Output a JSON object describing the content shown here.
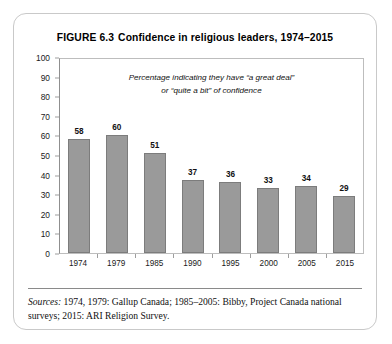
{
  "figure": {
    "label": "FIGURE 6.3",
    "title": "Confidence in religious leaders, 1974–2015",
    "annotation_line1": "Percentage indicating they have “a great deal”",
    "annotation_line2": "or “quite a bit” of confidence",
    "sources_label": "Sources:",
    "sources_text": " 1974, 1979: Gallup Canada; 1985–2005: Bibby, Project Canada national surveys; 2015: ARI Religion Survey.",
    "colors": {
      "bar_fill": "#9a9a9a",
      "bar_stroke": "#7c7c7c",
      "axis": "#8f8f8f",
      "card_border": "#c9c9c9",
      "text": "#111111"
    }
  },
  "chart_data": {
    "type": "bar",
    "subtitle": "Percentage indicating they have “a great deal” or “quite a bit” of confidence",
    "categories": [
      "1974",
      "1979",
      "1985",
      "1990",
      "1995",
      "2000",
      "2005",
      "2015"
    ],
    "values": [
      58,
      60,
      51,
      37,
      36,
      33,
      34,
      29
    ],
    "xlabel": "",
    "ylabel": "",
    "ylim": [
      0,
      100
    ],
    "yticks": [
      0,
      10,
      20,
      30,
      40,
      50,
      60,
      70,
      80,
      90,
      100
    ],
    "grid": false,
    "legend": false,
    "data_labels": true
  }
}
